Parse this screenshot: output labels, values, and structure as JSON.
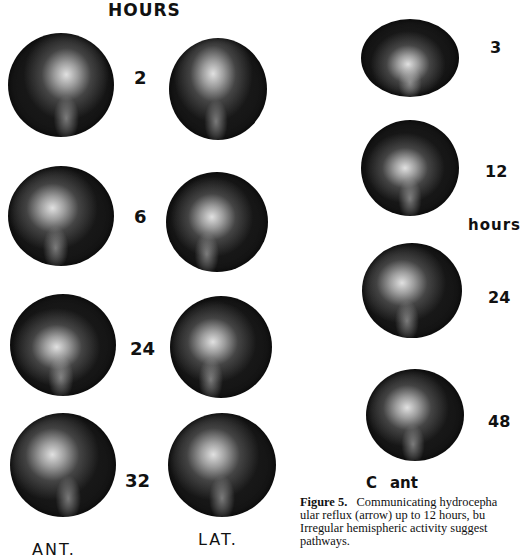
{
  "panel_left": {
    "header": "HOURS",
    "time_points": [
      "2",
      "6",
      "24",
      "32"
    ],
    "column_labels": {
      "left": "ANT.",
      "right": "LAT."
    }
  },
  "panel_right": {
    "time_points": [
      "3",
      "12",
      "24",
      "48"
    ],
    "unit_label": "hours",
    "panel_letter": "C",
    "view_label": "ant"
  },
  "caption": {
    "figure_label": "Figure 5.",
    "line1": "Communicating hydrocepha",
    "line2": "ular reflux (arrow) up to 12 hours, bu",
    "line3": "Irregular hemispheric activity suggest",
    "line4": "pathways."
  }
}
